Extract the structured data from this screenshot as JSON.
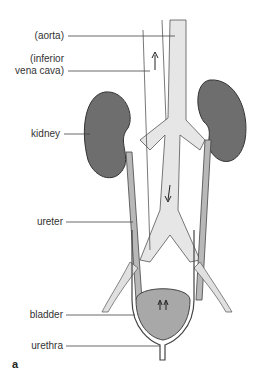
{
  "figure": {
    "panel_letter": "a",
    "labels": {
      "aorta": "(aorta)",
      "ivc_line1": "(inferior",
      "ivc_line2": "vena cava)",
      "kidney": "kidney",
      "ureter": "ureter",
      "bladder": "bladder",
      "urethra": "urethra"
    },
    "colors": {
      "kidney": "#6e6e6e",
      "ureter": "#b8b8b8",
      "aorta": "#e6e6e6",
      "bladder": "#a8a8a8",
      "line": "#444444"
    }
  }
}
